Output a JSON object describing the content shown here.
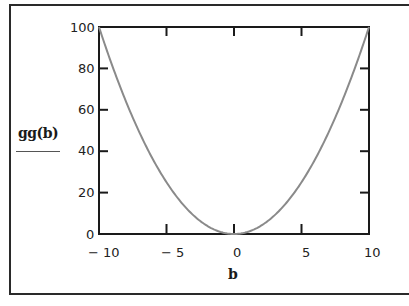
{
  "chart_data": {
    "type": "line",
    "title": "",
    "xlabel": "b",
    "ylabel": "gg(b)",
    "xlim": [
      -10,
      10
    ],
    "ylim": [
      0,
      100
    ],
    "x_ticks": [
      "-10",
      "-5",
      "0",
      "5",
      "10"
    ],
    "y_ticks": [
      "0",
      "20",
      "40",
      "60",
      "80",
      "100"
    ],
    "grid": false,
    "legend": null,
    "series": [
      {
        "name": "gg(b)",
        "x": [
          -10,
          -8,
          -6,
          -4,
          -2,
          0,
          2,
          4,
          6,
          8,
          10
        ],
        "values": [
          100,
          64,
          36,
          16,
          4,
          0,
          4,
          16,
          36,
          64,
          100
        ]
      }
    ],
    "colors": {
      "curve": "#8a8a8a",
      "axes": "#1a1a1a"
    }
  },
  "labels": {
    "ylabel": "gg(b)",
    "xlabel": "b",
    "x_ticks": [
      "− 10",
      "− 5",
      "0",
      "5",
      "10"
    ],
    "y_ticks": [
      "100",
      "80",
      "60",
      "40",
      "20",
      "0"
    ]
  }
}
